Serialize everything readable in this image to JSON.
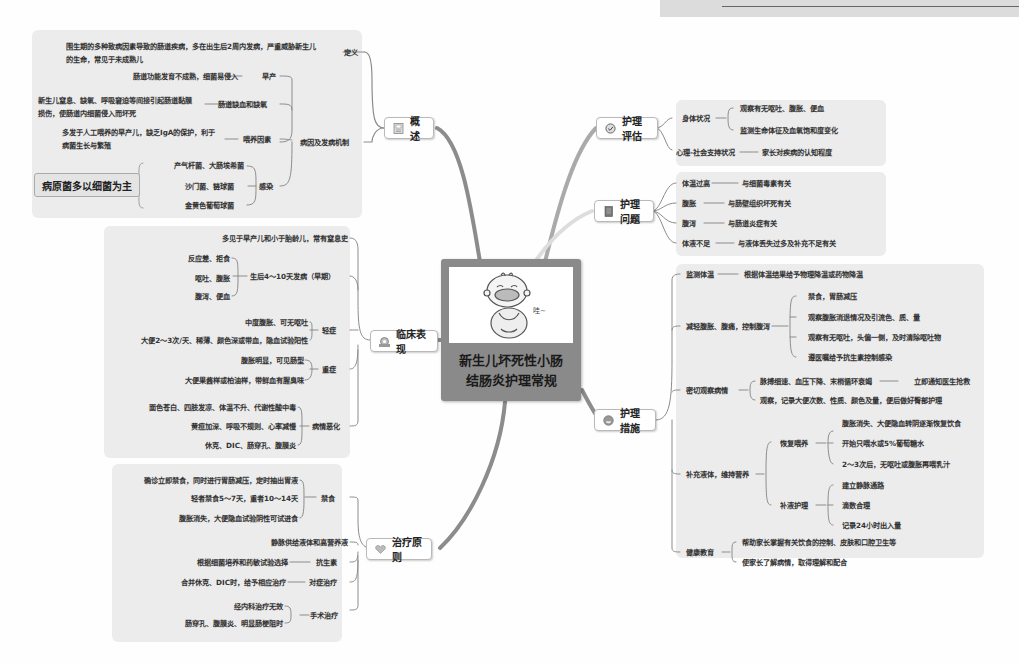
{
  "center": {
    "title_line1": "新生儿坏死性小肠",
    "title_line2": "结肠炎护理常规",
    "image": "crying-baby-illustration"
  },
  "branches": {
    "overview": {
      "label": "概述",
      "icon": "document-icon",
      "definition": {
        "label": "定义",
        "text": "围生期的多种致病因素导致的肠道疾病，多在出生后2周内发病，严重威胁新生儿的生命，常见于未成熟儿"
      },
      "etiology": {
        "label": "病因及发病机制",
        "items": [
          {
            "label": "早产",
            "detail": "肠道功能发育不成熟，细菌易侵入"
          },
          {
            "label": "肠道缺血和缺氧",
            "detail": "新生儿窒息、缺氧、呼吸窘迫等间接引起肠道黏膜损伤，使肠道内细菌侵入而坏死"
          },
          {
            "label": "喂养因素",
            "detail": "多发于人工喂养的早产儿，缺乏IgA的保护，利于病菌生长与繁殖"
          },
          {
            "label": "感染",
            "children": [
              "产气杆菌、大肠埃希菌",
              "沙门菌、链球菌",
              "金黄色葡萄球菌"
            ]
          }
        ],
        "callout": "病原菌多以细菌为主"
      }
    },
    "clinical": {
      "label": "临床表现",
      "icon": "gear-icon",
      "items": [
        {
          "label": "多见于早产儿和小于胎龄儿，常有窒息史"
        },
        {
          "label": "生后4～10天发病（早期）",
          "children": [
            "反应差、拒食",
            "呕吐、腹胀",
            "腹泻、便血"
          ]
        },
        {
          "label": "轻症",
          "children": [
            "中度腹胀、可无呕吐",
            "大便2～3次/天、稀薄、颜色深或带血，隐血试验阳性"
          ]
        },
        {
          "label": "重症",
          "children": [
            "腹胀明显，可见肠型",
            "大便果酱样或柏油样，带鲜血有腥臭味"
          ]
        },
        {
          "label": "病情恶化",
          "children": [
            "面色苍白、四肢发凉、体温不升、代谢性酸中毒",
            "黄疸加深、呼吸不规则、心率减慢",
            "休克、DIC、肠穿孔、腹膜炎"
          ]
        }
      ]
    },
    "treatment": {
      "label": "治疗原则",
      "icon": "heart-icon",
      "items": [
        {
          "label": "禁食",
          "children": [
            "确诊立即禁食，同时进行胃肠减压，定时抽出胃液",
            "轻者禁食5～7天，重者10～14天",
            "腹胀消失，大便隐血试验阴性可试进食"
          ]
        },
        {
          "label": "静脉供给液体和高营养液"
        },
        {
          "label": "抗生素",
          "detail": "根据细菌培养和药敏试验选择"
        },
        {
          "label": "对症治疗",
          "detail": "合并休克、DIC时，给予相应治疗"
        },
        {
          "label": "手术治疗",
          "children": [
            "经内科治疗无效",
            "肠穿孔、腹膜炎、明显肠梗阻时"
          ]
        }
      ]
    },
    "assessment": {
      "label": "护理评估",
      "icon": "check-circle-icon",
      "items": [
        {
          "label": "身体状况",
          "children": [
            "观察有无呕吐、腹胀、便血",
            "监测生命体征及血氧饱和度变化"
          ]
        },
        {
          "label": "心理-社会支持状况",
          "detail": "家长对疾病的认知程度"
        }
      ]
    },
    "problems": {
      "label": "护理问题",
      "icon": "notebook-icon",
      "items": [
        {
          "label": "体温过高",
          "detail": "与细菌毒素有关"
        },
        {
          "label": "腹胀",
          "detail": "与肠壁组织坏死有关"
        },
        {
          "label": "腹泻",
          "detail": "与肠道炎症有关"
        },
        {
          "label": "体液不足",
          "detail": "与液体丢失过多及补充不足有关"
        }
      ]
    },
    "measures": {
      "label": "护理措施",
      "icon": "face-icon",
      "items": [
        {
          "label": "监测体温",
          "detail": "根据体温结果给予物理降温或药物降温"
        },
        {
          "label": "减轻腹胀、腹痛，控制腹泻",
          "children": [
            "禁食，胃肠减压",
            "观察腹胀消退情况及引流色、质、量",
            "观察有无呕吐，头偏一侧，及时清除呕吐物",
            "遵医嘱给予抗生素控制感染"
          ]
        },
        {
          "label": "密切观察病情",
          "children": [
            "脉搏细速、血压下降、末梢循环衰竭",
            "观察，记录大便次数、性质、颜色及量，便后做好臀部护理"
          ],
          "action": "立即通知医生抢救"
        },
        {
          "label": "补充液体，维持营养",
          "groups": [
            {
              "label": "恢复喂养",
              "children": [
                "腹胀消失、大便隐血转阴逐渐恢复饮食",
                "开始只喂水或5%葡萄糖水",
                "2～3次后，无呕吐或腹胀再喂乳汁"
              ]
            },
            {
              "label": "补液护理",
              "children": [
                "建立静脉通路",
                "滴数合理",
                "记录24小时出入量"
              ]
            }
          ]
        },
        {
          "label": "健康教育",
          "children": [
            "帮助家长掌握有关饮食的控制、皮肤和口腔卫生等",
            "使家长了解病情，取得理解和配合"
          ]
        }
      ]
    }
  },
  "colors": {
    "panel": "#ececec",
    "connector": "#8c8c8c",
    "center_bg": "#8a8a8a",
    "node_border": "#b9b9b9"
  }
}
